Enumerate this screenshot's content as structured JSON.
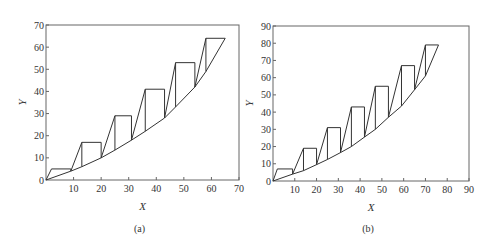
{
  "chart_data": [
    {
      "type": "line",
      "panel_label": "(a)",
      "xlabel": "X",
      "ylabel": "Y",
      "xlim": [
        0,
        70
      ],
      "ylim": [
        0,
        70
      ],
      "xticks": [
        10,
        20,
        30,
        40,
        50,
        60,
        70
      ],
      "yticks": [
        0,
        10,
        20,
        30,
        40,
        50,
        60,
        70
      ],
      "grid": false,
      "curve": [
        [
          0,
          0
        ],
        [
          9,
          4
        ],
        [
          13,
          6
        ],
        [
          20,
          10
        ],
        [
          25,
          13.5
        ],
        [
          31,
          18
        ],
        [
          36,
          22
        ],
        [
          43,
          28
        ],
        [
          47,
          33
        ],
        [
          54,
          42
        ],
        [
          58,
          49
        ],
        [
          65,
          64
        ]
      ],
      "steps": [
        {
          "rise_from": [
            0,
            0
          ],
          "top": [
            [
              2,
              5
            ],
            [
              9,
              5
            ]
          ],
          "drop_to": [
            9,
            4
          ]
        },
        {
          "rise_from": [
            9,
            4
          ],
          "top": [
            [
              13,
              17
            ],
            [
              20,
              17
            ]
          ],
          "drop_to": [
            20,
            10
          ]
        },
        {
          "rise_from": [
            20,
            10
          ],
          "top": [
            [
              25,
              29
            ],
            [
              31,
              29
            ]
          ],
          "drop_to": [
            31,
            18
          ]
        },
        {
          "rise_from": [
            31,
            18
          ],
          "top": [
            [
              36,
              41
            ],
            [
              43,
              41
            ]
          ],
          "drop_to": [
            43,
            28
          ]
        },
        {
          "rise_from": [
            43,
            28
          ],
          "top": [
            [
              47,
              53
            ],
            [
              54,
              53
            ]
          ],
          "drop_to": [
            54,
            42
          ]
        },
        {
          "rise_from": [
            54,
            42
          ],
          "top": [
            [
              58,
              64
            ],
            [
              65,
              64
            ]
          ],
          "drop_to": [
            65,
            64
          ]
        }
      ],
      "verticals": [
        [
          13,
          6,
          17
        ],
        [
          25,
          13.5,
          29
        ],
        [
          36,
          22,
          41
        ],
        [
          47,
          33,
          53
        ],
        [
          58,
          49,
          64
        ]
      ]
    },
    {
      "type": "line",
      "panel_label": "(b)",
      "xlabel": "X",
      "ylabel": "Y",
      "xlim": [
        0,
        90
      ],
      "ylim": [
        0,
        90
      ],
      "xticks": [
        10,
        20,
        30,
        40,
        50,
        60,
        70,
        80,
        90
      ],
      "yticks": [
        0,
        10,
        20,
        30,
        40,
        50,
        60,
        70,
        80,
        90
      ],
      "grid": false,
      "curve": [
        [
          0,
          0
        ],
        [
          9,
          4
        ],
        [
          14,
          6
        ],
        [
          20,
          9.5
        ],
        [
          25,
          12.5
        ],
        [
          31,
          16.5
        ],
        [
          36,
          20
        ],
        [
          42,
          25.5
        ],
        [
          47,
          30
        ],
        [
          53,
          37
        ],
        [
          59,
          43.5
        ],
        [
          65,
          53
        ],
        [
          70,
          61
        ],
        [
          76,
          79
        ]
      ],
      "steps": [
        {
          "rise_from": [
            0,
            0
          ],
          "top": [
            [
              2,
              7
            ],
            [
              9,
              7
            ]
          ],
          "drop_to": [
            9,
            4
          ]
        },
        {
          "rise_from": [
            9,
            4
          ],
          "top": [
            [
              14,
              19
            ],
            [
              20,
              19
            ]
          ],
          "drop_to": [
            20,
            9.5
          ]
        },
        {
          "rise_from": [
            20,
            9.5
          ],
          "top": [
            [
              25,
              31
            ],
            [
              31,
              31
            ]
          ],
          "drop_to": [
            31,
            16.5
          ]
        },
        {
          "rise_from": [
            31,
            16.5
          ],
          "top": [
            [
              36,
              43
            ],
            [
              42,
              43
            ]
          ],
          "drop_to": [
            42,
            25.5
          ]
        },
        {
          "rise_from": [
            42,
            25.5
          ],
          "top": [
            [
              47,
              55
            ],
            [
              53,
              55
            ]
          ],
          "drop_to": [
            53,
            37
          ]
        },
        {
          "rise_from": [
            53,
            37
          ],
          "top": [
            [
              59,
              67
            ],
            [
              65,
              67
            ]
          ],
          "drop_to": [
            65,
            53
          ]
        },
        {
          "rise_from": [
            65,
            53
          ],
          "top": [
            [
              70,
              79
            ],
            [
              76,
              79
            ]
          ],
          "drop_to": [
            76,
            79
          ]
        }
      ],
      "verticals": [
        [
          14,
          6,
          19
        ],
        [
          25,
          12.5,
          31
        ],
        [
          36,
          20,
          43
        ],
        [
          47,
          30,
          55
        ],
        [
          59,
          43.5,
          67
        ],
        [
          70,
          61,
          79
        ]
      ]
    }
  ],
  "panels": [
    {
      "frame": {
        "x0": 46,
        "y0": 180,
        "x1": 239,
        "y1": 25
      }
    },
    {
      "frame": {
        "x0": 273,
        "y0": 181,
        "x1": 469,
        "y1": 26
      }
    }
  ]
}
